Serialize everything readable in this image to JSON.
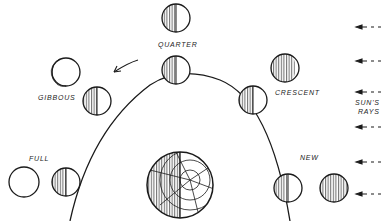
{
  "diagram": {
    "labels": {
      "quarter": "QUARTER",
      "gibbous": "GIBBOUS",
      "crescent": "CRESCENT",
      "full": "FULL",
      "new": "NEW",
      "suns_rays_line1": "SUN'S",
      "suns_rays_line2": "RAYS"
    },
    "orbit_positions": [
      {
        "phase": "quarter",
        "orbit_moon": [
          176,
          70
        ],
        "view_moon": [
          176,
          18
        ]
      },
      {
        "phase": "gibbous",
        "orbit_moon": [
          97,
          101
        ],
        "view_moon": [
          66,
          72
        ]
      },
      {
        "phase": "crescent",
        "orbit_moon": [
          253,
          100
        ],
        "view_moon": [
          285,
          68
        ]
      },
      {
        "phase": "full",
        "orbit_moon": [
          66,
          182
        ],
        "view_moon": [
          24,
          182
        ]
      },
      {
        "phase": "new",
        "orbit_moon": [
          288,
          188
        ],
        "view_moon": [
          334,
          188
        ]
      }
    ],
    "earth": {
      "center": [
        180,
        185
      ],
      "radius": 33
    },
    "sun_ray_count": 6,
    "arrow_direction": "counter-clockwise",
    "colors": {
      "ink": "#1a1a1a",
      "background": "#ffffff"
    }
  }
}
